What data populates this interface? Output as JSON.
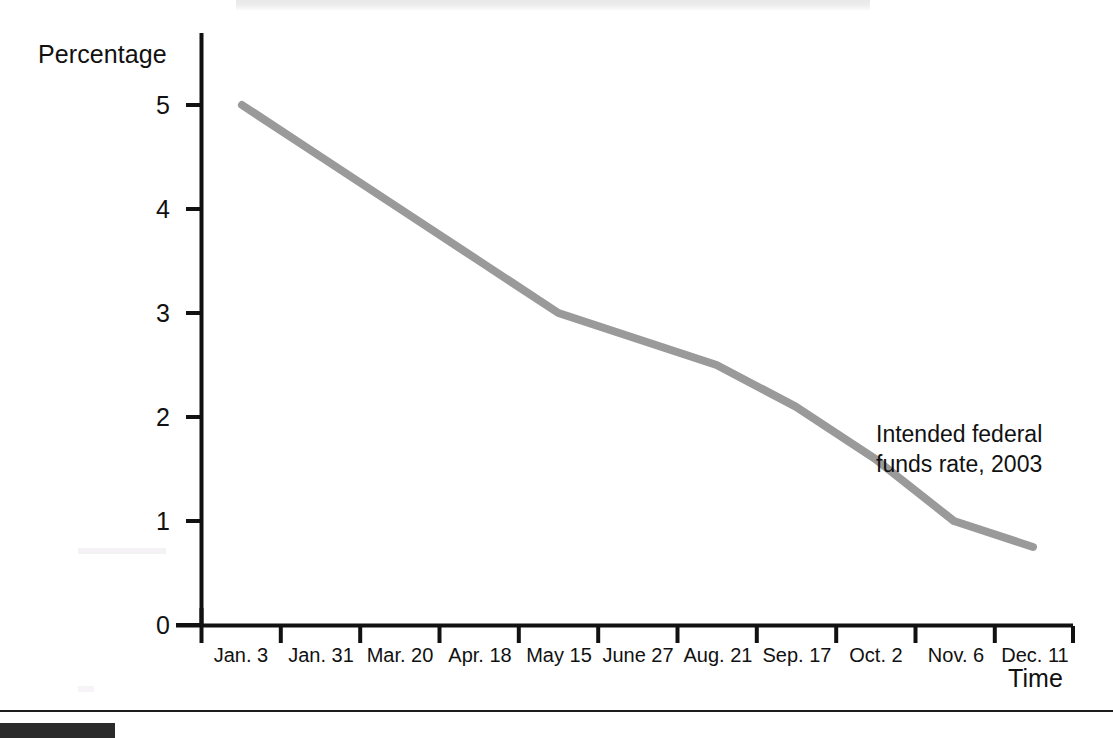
{
  "figure": {
    "y_axis_title": "Percentage",
    "x_axis_title": "Time",
    "annotation_line1": "Intended federal",
    "annotation_line2": "funds rate, 2003",
    "line_color": "#9a9a9a",
    "axis_color": "#111111"
  },
  "chart_data": {
    "type": "line",
    "title": "",
    "xlabel": "Time",
    "ylabel": "Percentage",
    "ylim": [
      0,
      5.6
    ],
    "yticks": [
      "0",
      "1",
      "2",
      "3",
      "4",
      "5"
    ],
    "ytick_values": [
      0,
      1,
      2,
      3,
      4,
      5
    ],
    "grid": false,
    "legend": "none",
    "annotations": [
      "Intended federal funds rate, 2003"
    ],
    "categories": [
      "Jan. 3",
      "Jan. 31",
      "Mar. 20",
      "Apr. 18",
      "May 15",
      "June 27",
      "Aug. 21",
      "Sep. 17",
      "Oct. 2",
      "Nov. 6",
      "Dec. 11"
    ],
    "series": [
      {
        "name": "Intended federal funds rate, 2003",
        "values": [
          5.0,
          4.5,
          4.0,
          3.5,
          3.0,
          2.75,
          2.5,
          2.1,
          1.6,
          1.0,
          0.75
        ]
      }
    ]
  }
}
